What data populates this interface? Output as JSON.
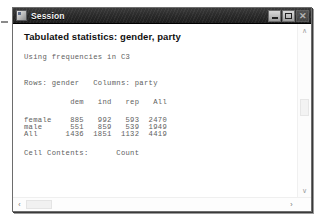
{
  "window": {
    "title": "Session",
    "icon": "session-window-icon",
    "buttons": [
      {
        "name": "minimize",
        "label": "–",
        "glyph": "minimize-icon",
        "enabled": true
      },
      {
        "name": "maximize",
        "label": "□",
        "glyph": "maximize-icon",
        "enabled": true
      },
      {
        "name": "close",
        "label": "✕",
        "glyph": "close-icon",
        "enabled": false
      }
    ]
  },
  "output": {
    "heading": "Tabulated statistics: gender, party",
    "using_line": "Using frequencies in C3",
    "rows_columns_line": "Rows: gender   Columns: party",
    "cell_contents_label": "Cell Contents:",
    "cell_contents_value": "Count"
  },
  "scrollbars": {
    "vertical": {
      "up_arrow": "∧",
      "down_arrow": "∨"
    },
    "horizontal": {
      "left_arrow": "‹",
      "right_arrow": "›"
    }
  },
  "chart_data": {
    "type": "table",
    "title": "Tabulated statistics: gender, party",
    "subtitle": "Using frequencies in C3",
    "row_variable": "gender",
    "column_variable": "party",
    "cell_contents": "Count",
    "row_header_label": "",
    "categories": [
      "dem",
      "ind",
      "rep",
      "All"
    ],
    "rows": [
      {
        "label": "female",
        "values": [
          885,
          992,
          593,
          2470
        ]
      },
      {
        "label": "male",
        "values": [
          551,
          859,
          539,
          1949
        ]
      },
      {
        "label": "All",
        "values": [
          1436,
          1851,
          1132,
          4419
        ]
      }
    ],
    "text_lines": [
      "Using frequencies in C3",
      "Rows: gender   Columns: party",
      "          dem   ind   rep   All",
      "female    885   992   593  2470",
      "male      551   859   539  1949",
      "All      1436  1851  1132  4419",
      "Cell Contents:      Count"
    ],
    "xlabel": "party",
    "ylabel": "gender",
    "grid": false,
    "legend": "none"
  }
}
